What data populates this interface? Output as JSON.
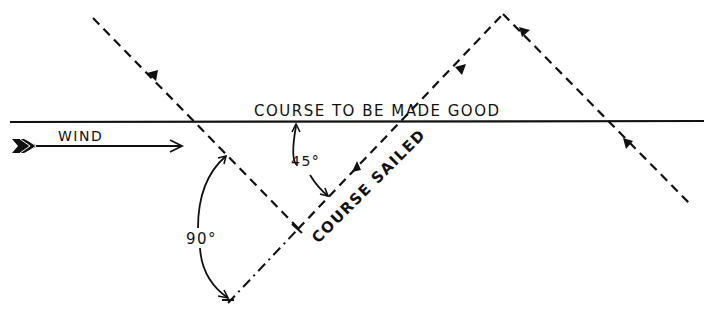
{
  "diagram": {
    "labels": {
      "course_to_be_made_good": "COURSE TO BE MADE GOOD",
      "wind": "WIND",
      "course_sailed": "COURSE SAILED",
      "angle_45": "45°",
      "angle_90": "90°"
    },
    "colors": {
      "ink": "#111111",
      "background": "#ffffff"
    }
  }
}
